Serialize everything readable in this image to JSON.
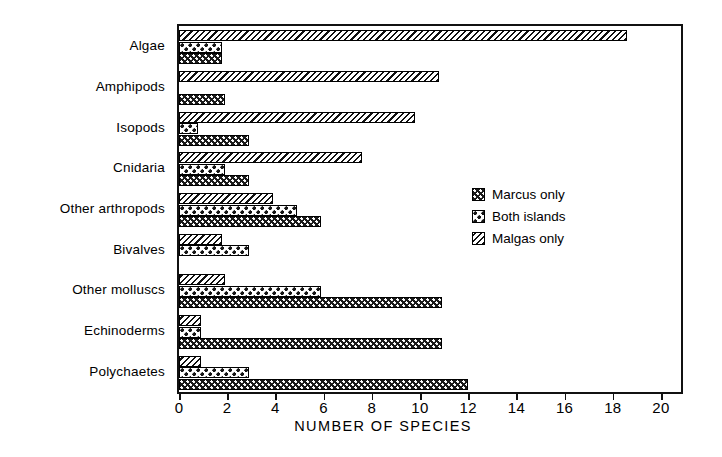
{
  "chart_data": {
    "type": "bar",
    "orientation": "horizontal",
    "title": "",
    "xlabel": "NUMBER OF SPECIES",
    "ylabel": "",
    "xlim": [
      0,
      20
    ],
    "xticks": [
      0,
      2,
      4,
      6,
      8,
      10,
      12,
      14,
      16,
      18,
      20
    ],
    "xtick_labels": [
      "0",
      "2",
      "4",
      "6",
      "8",
      "10",
      "12",
      "14",
      "16",
      "18",
      "20"
    ],
    "grid": false,
    "legend_position": "center-right",
    "categories": [
      "Algae",
      "Amphipods",
      "Isopods",
      "Cnidaria",
      "Other arthropods",
      "Bivalves",
      "Other molluscs",
      "Echinoderms",
      "Polychaetes"
    ],
    "series": [
      {
        "name": "Malgas only",
        "pattern": "diagonal-hatch",
        "values": [
          18.6,
          10.8,
          9.8,
          7.6,
          3.9,
          1.8,
          1.9,
          0.9,
          0.9
        ]
      },
      {
        "name": "Both islands",
        "pattern": "white-with-dark-dots",
        "values": [
          1.8,
          0,
          0.8,
          1.9,
          4.9,
          2.9,
          5.9,
          0.9,
          2.9
        ]
      },
      {
        "name": "Marcus only",
        "pattern": "dark-with-white-dots",
        "values": [
          1.8,
          1.9,
          2.9,
          2.9,
          5.9,
          0,
          10.9,
          10.9,
          12.0
        ]
      }
    ]
  },
  "legend": {
    "items": [
      {
        "label": "Marcus only",
        "pattern": "dark-with-white-dots"
      },
      {
        "label": "Both islands",
        "pattern": "white-with-dark-dots"
      },
      {
        "label": "Malgas only",
        "pattern": "diagonal-hatch"
      }
    ]
  },
  "colors": {
    "ink": "#111111",
    "background": "#ffffff"
  }
}
